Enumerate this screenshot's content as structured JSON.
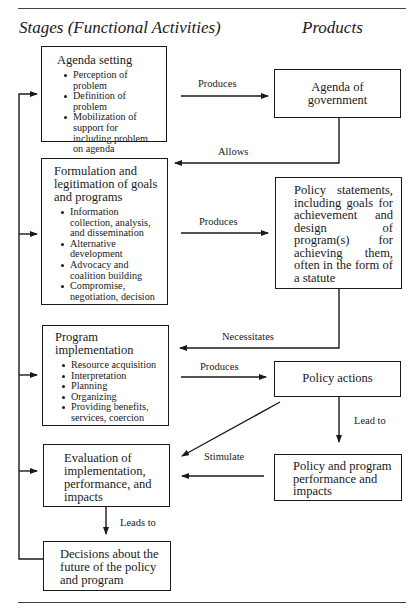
{
  "headers": {
    "stages": "Stages (Functional Activities)",
    "products": "Products"
  },
  "stages": [
    {
      "title": "Agenda setting",
      "items": [
        "Perception of problem",
        "Definition of problem",
        "Mobilization of support for including problem on agenda"
      ]
    },
    {
      "title": "Formulation and legitimation of goals and programs",
      "items": [
        "Information collection, analysis, and dissemination",
        "Alternative development",
        "Advocacy and coalition building",
        "Compromise, negotiation, decision"
      ]
    },
    {
      "title": "Program implementation",
      "items": [
        "Resource acquisition",
        "Interpretation",
        "Planning",
        "Organizing",
        "Providing benefits, services, coercion"
      ]
    },
    {
      "title": "Evaluation of implementation, performance, and impacts",
      "items": []
    },
    {
      "title": "Decisions about the future of the policy and program",
      "items": []
    }
  ],
  "products": [
    {
      "text": "Agenda of government"
    },
    {
      "text": "Policy statements, including goals for achievement and design of program(s) for achieving them, often in the form of a statute"
    },
    {
      "text": "Policy actions"
    },
    {
      "text": "Policy and program performance and impacts"
    }
  ],
  "edges": {
    "produces_1": "Produces",
    "allows": "Allows",
    "produces_2": "Produces",
    "necessitates": "Necessitates",
    "produces_3": "Produces",
    "lead_to": "Lead to",
    "stimulate": "Stimulate",
    "leads_to": "Leads to"
  }
}
